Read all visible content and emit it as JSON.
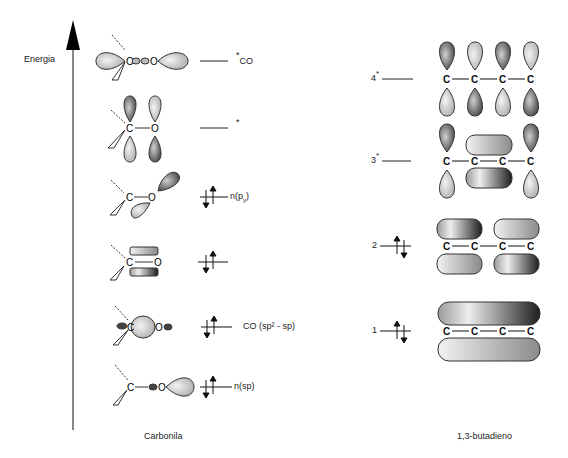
{
  "axis": {
    "label": "Energia"
  },
  "carbonyl": {
    "caption": "Carbonila",
    "levels": [
      {
        "id": "pi-star",
        "label": "*",
        "sub": "CO",
        "occupied": false
      },
      {
        "id": "sigma-star",
        "label": "*",
        "sub": "",
        "occupied": false
      },
      {
        "id": "n-py",
        "label": "n(p",
        "sub": "y",
        "suffix": ")",
        "occupied": true
      },
      {
        "id": "pi",
        "label": "",
        "occupied": true
      },
      {
        "id": "sigma",
        "label": "CO (sp² - sp)",
        "occupied": true
      },
      {
        "id": "n-sp",
        "label": "n(sp)",
        "occupied": true
      }
    ]
  },
  "butadiene": {
    "caption": "1,3-butadieno",
    "levels": [
      {
        "n": "4",
        "star": "*",
        "occupied": false
      },
      {
        "n": "3",
        "star": "*",
        "occupied": false
      },
      {
        "n": "2",
        "star": "",
        "occupied": true
      },
      {
        "n": "1",
        "star": "",
        "occupied": true
      }
    ],
    "atom": "C"
  },
  "atoms": {
    "C": "C",
    "O": "O"
  }
}
